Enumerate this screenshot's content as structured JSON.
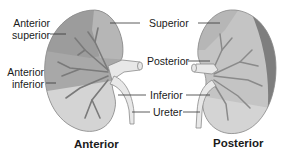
{
  "figure": {
    "colors": {
      "background": "#ffffff",
      "label_text": "#1a1a1a",
      "leader_line": "#333333",
      "anterior_superior": "#9c9c9c",
      "superior": "#b6b6b6",
      "anterior_inferior": "#a8a8a8",
      "inferior": "#d4d4d4",
      "posterior": "#c4c4c4",
      "posterior_rim": "#7e7e7e",
      "vessels": "#7a7a7a",
      "hilum_ureter": "#e8e8e8"
    }
  },
  "anterior_view": {
    "caption": "Anterior",
    "labels": {
      "anterior_superior_line1": "Anterior",
      "anterior_superior_line2": "superior",
      "anterior_inferior_line1": "Anterior",
      "anterior_inferior_line2": "inferior"
    }
  },
  "center_labels": {
    "superior": "Superior",
    "posterior": "Posterior",
    "inferior": "Inferior",
    "ureter": "Ureter"
  },
  "posterior_view": {
    "caption": "Posterior"
  }
}
